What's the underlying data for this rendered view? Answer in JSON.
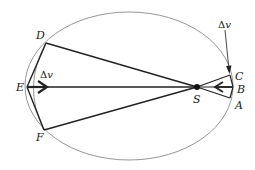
{
  "diagram": {
    "colors": {
      "orbit": "#8a8a8a",
      "lines": "#222222",
      "text": "#1a1a1a",
      "background": "#ffffff"
    },
    "points": {
      "A": "A",
      "B": "B",
      "C": "C",
      "D": "D",
      "E": "E",
      "F": "F",
      "S": "S"
    },
    "delta_v_labels": {
      "upper_right": {
        "delta": "Δ",
        "v": "v"
      },
      "left": {
        "delta": "Δ",
        "v": "v"
      }
    }
  }
}
